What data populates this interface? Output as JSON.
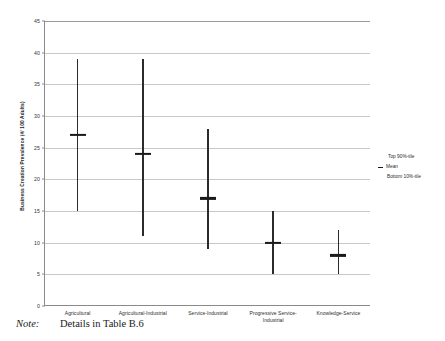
{
  "chart_data": {
    "type": "line",
    "title": "",
    "xlabel": "",
    "ylabel": "Business Creation Prevalence (#/ 100 Adults)",
    "ylim": [
      0,
      45
    ],
    "yticks": [
      0,
      5,
      10,
      15,
      20,
      25,
      30,
      35,
      40,
      45
    ],
    "grid": true,
    "legend_position": "right",
    "categories": [
      "Agricultural",
      "Agricultural-Industrial",
      "Service-Industrial",
      "Progressive Service-Industrial",
      "Knowledge-Service"
    ],
    "series": [
      {
        "name": "Top 90%-tile",
        "values": [
          39,
          39,
          28,
          15,
          12
        ]
      },
      {
        "name": "Mean",
        "values": [
          27,
          24,
          17,
          10,
          8
        ]
      },
      {
        "name": "Bottom 10%-tile",
        "values": [
          15,
          11,
          9,
          5,
          5
        ]
      }
    ],
    "points": [
      {
        "category": "Agricultural",
        "top": 39,
        "mean": 27,
        "bottom": 15
      },
      {
        "category": "Agricultural-Industrial",
        "top": 39,
        "mean": 24,
        "bottom": 11
      },
      {
        "category": "Service-Industrial",
        "top": 28,
        "mean": 17,
        "bottom": 9
      },
      {
        "category": "Progressive Service-Industrial",
        "top": 15,
        "mean": 10,
        "bottom": 5
      },
      {
        "category": "Knowledge-Service",
        "top": 12,
        "mean": 8,
        "bottom": 5
      }
    ],
    "colors": {
      "line": "#2b2b2b",
      "mean": "#1a1a1a",
      "grid": "#c8c8c8",
      "axis": "#8a8a8a",
      "background": "#ffffff"
    }
  },
  "axis": {
    "y_title": "Business Creation Prevalence (#/ 100 Adults)",
    "y_tick_labels": [
      "45",
      "40",
      "35",
      "30",
      "25",
      "20",
      "15",
      "10",
      "5",
      "0"
    ],
    "x_tick_labels": [
      "Agricultural",
      "Agricultural-Industrial",
      "Service-Industrial",
      "Progressive Service-Industrial",
      "Knowledge-Service"
    ]
  },
  "legend": {
    "items": [
      {
        "label": "Top 90%-tile"
      },
      {
        "label": "Mean"
      },
      {
        "label": "Bottom 10%-tile"
      }
    ]
  },
  "note": {
    "label": "Note:",
    "text": "Details in Table B.6"
  }
}
